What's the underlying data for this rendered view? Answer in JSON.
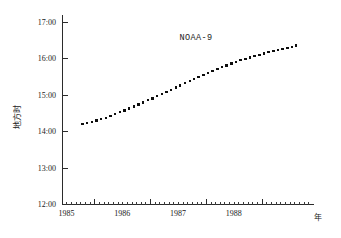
{
  "chart_data": {
    "type": "scatter",
    "title": "NOAA-9",
    "xlabel": "年",
    "ylabel": "地方时",
    "x_tick_labels": [
      "1985",
      "1986",
      "1987",
      "1988"
    ],
    "x_tick_values": [
      1985.0,
      1986.0,
      1987.0,
      1988.0
    ],
    "xlim": [
      1984.42,
      1988.92
    ],
    "y_tick_labels": [
      "12:00",
      "13:00",
      "14:00",
      "15:00",
      "16:00",
      "17:00"
    ],
    "y_tick_values": [
      12.0,
      13.0,
      14.0,
      15.0,
      16.0,
      17.0
    ],
    "ylim": [
      12.0,
      17.0
    ],
    "grid": false,
    "legend": false,
    "minor_ticks_per_year": 12,
    "series": [
      {
        "name": "NOAA-9 local equator crossing time",
        "marker": "square",
        "x": [
          1984.79,
          1984.87,
          1984.96,
          1985.04,
          1985.12,
          1985.21,
          1985.29,
          1985.37,
          1985.46,
          1985.54,
          1985.62,
          1985.71,
          1985.79,
          1985.87,
          1985.96,
          1986.04,
          1986.12,
          1986.21,
          1986.29,
          1986.37,
          1986.46,
          1986.54,
          1986.62,
          1986.71,
          1986.79,
          1986.87,
          1986.96,
          1987.04,
          1987.12,
          1987.21,
          1987.29,
          1987.37,
          1987.46,
          1987.54,
          1987.62,
          1987.71,
          1987.79,
          1987.87,
          1987.96,
          1988.04,
          1988.12,
          1988.21,
          1988.29,
          1988.37,
          1988.46,
          1988.54,
          1988.62
        ],
        "y": [
          14.19,
          14.22,
          14.25,
          14.29,
          14.33,
          14.37,
          14.42,
          14.47,
          14.52,
          14.57,
          14.62,
          14.68,
          14.73,
          14.79,
          14.85,
          14.9,
          14.96,
          15.02,
          15.08,
          15.14,
          15.2,
          15.26,
          15.32,
          15.38,
          15.43,
          15.49,
          15.55,
          15.6,
          15.66,
          15.71,
          15.76,
          15.81,
          15.86,
          15.9,
          15.95,
          15.99,
          16.03,
          16.07,
          16.1,
          16.14,
          16.17,
          16.2,
          16.23,
          16.26,
          16.29,
          16.32,
          16.35
        ]
      }
    ]
  }
}
